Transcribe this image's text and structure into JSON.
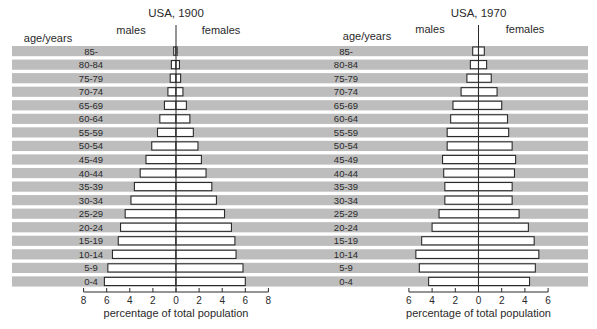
{
  "chart_data": [
    {
      "type": "bar",
      "subtype": "population-pyramid",
      "title": "USA, 1900",
      "left_label": "males",
      "right_label": "females",
      "row_header": "age/years",
      "xlabel": "percentage of total population",
      "xlim": [
        -8,
        8
      ],
      "xticks": [
        -8,
        -6,
        -4,
        -2,
        0,
        2,
        4,
        6,
        8
      ],
      "xtick_labels": [
        "8",
        "6",
        "4",
        "2",
        "0",
        "2",
        "4",
        "6",
        "8"
      ],
      "categories": [
        "85-",
        "80-84",
        "75-79",
        "70-74",
        "65-69",
        "60-64",
        "55-59",
        "50-54",
        "45-49",
        "40-44",
        "35-39",
        "30-34",
        "25-29",
        "20-24",
        "15-19",
        "10-14",
        "5-9",
        "0-4"
      ],
      "series": [
        {
          "name": "males",
          "values": [
            0.2,
            0.4,
            0.5,
            0.7,
            1.0,
            1.4,
            1.6,
            2.1,
            2.6,
            3.1,
            3.6,
            3.9,
            4.4,
            4.8,
            5.0,
            5.5,
            5.9,
            6.2
          ]
        },
        {
          "name": "females",
          "values": [
            0.1,
            0.3,
            0.4,
            0.6,
            0.9,
            1.2,
            1.5,
            1.9,
            2.2,
            2.6,
            3.1,
            3.5,
            4.2,
            4.8,
            5.1,
            5.2,
            5.8,
            6.0
          ]
        }
      ],
      "grid": false
    },
    {
      "type": "bar",
      "subtype": "population-pyramid",
      "title": "USA, 1970",
      "left_label": "males",
      "right_label": "females",
      "row_header": "age/years",
      "xlabel": "percentage of total population",
      "xlim": [
        -6,
        6
      ],
      "xticks": [
        -6,
        -4,
        -2,
        0,
        2,
        4,
        6
      ],
      "xtick_labels": [
        "6",
        "4",
        "2",
        "0",
        "2",
        "4",
        "6"
      ],
      "categories": [
        "85-",
        "80-84",
        "75-79",
        "70-74",
        "65-69",
        "60-64",
        "55-59",
        "50-54",
        "45-49",
        "40-44",
        "35-39",
        "30-34",
        "25-29",
        "20-24",
        "15-19",
        "10-14",
        "5-9",
        "0-4"
      ],
      "series": [
        {
          "name": "males",
          "values": [
            0.5,
            0.7,
            1.0,
            1.5,
            2.2,
            2.4,
            2.7,
            2.7,
            3.1,
            3.0,
            2.9,
            2.9,
            3.4,
            4.0,
            4.9,
            5.4,
            5.1,
            4.3
          ]
        },
        {
          "name": "females",
          "values": [
            0.5,
            0.7,
            1.1,
            1.6,
            2.0,
            2.5,
            2.6,
            2.9,
            3.2,
            3.1,
            2.9,
            2.9,
            3.5,
            4.3,
            4.8,
            5.2,
            4.9,
            4.4
          ]
        }
      ],
      "grid": false
    }
  ]
}
